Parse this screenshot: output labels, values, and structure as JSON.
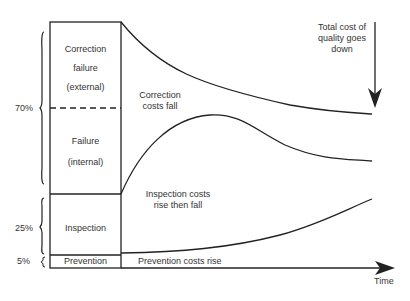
{
  "diagram": {
    "colors": {
      "line": "#222222",
      "text": "#333333",
      "background": "#ffffff"
    },
    "stack": {
      "blocks": [
        {
          "id": "correction-failure-external",
          "lines": [
            "Correction",
            "failure",
            "(external)"
          ]
        },
        {
          "id": "failure-internal",
          "lines": [
            "Failure",
            "(internal)"
          ]
        },
        {
          "id": "inspection",
          "lines": [
            "Inspection"
          ]
        },
        {
          "id": "prevention",
          "lines": [
            "Prevention"
          ]
        }
      ],
      "percentages": [
        {
          "label": "70%",
          "covers": "correction + failure"
        },
        {
          "label": "25%",
          "covers": "inspection"
        },
        {
          "label": "5%",
          "covers": "prevention"
        }
      ]
    },
    "annotations": {
      "correction": [
        "Correction",
        "costs fall"
      ],
      "inspection": [
        "Inspection costs",
        "rise then fall"
      ],
      "prevention": "Prevention costs rise",
      "total": [
        "Total cost of",
        "quality goes",
        "down"
      ]
    },
    "axis": {
      "x_label": "Time"
    }
  }
}
